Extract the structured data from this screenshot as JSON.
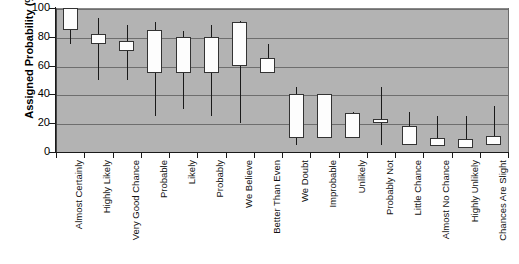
{
  "chart_data": {
    "type": "box",
    "title": "",
    "xlabel": "",
    "ylabel": "Assigned Probability (%)",
    "ylim": [
      0,
      100
    ],
    "yticks": [
      0,
      20,
      40,
      60,
      80,
      100
    ],
    "grid": true,
    "legend": "none",
    "plot_background": "#b3b3b3",
    "box_fill": "#fdfdfd",
    "box_stroke": "#333333",
    "categories": [
      "Almost Certainly",
      "Highly Likely",
      "Very Good Chance",
      "Probable",
      "Likely",
      "Probably",
      "We Believe",
      "Better Than Even",
      "We Doubt",
      "Improbable",
      "Unlikely",
      "Probably Not",
      "Little Chance",
      "Almost No Chance",
      "Highly Unlikely",
      "Chances Are Slight"
    ],
    "boxes": [
      {
        "category": "Almost Certainly",
        "whisker_low": 75,
        "q1": 85,
        "q3": 100,
        "whisker_high": 100
      },
      {
        "category": "Highly Likely",
        "whisker_low": 50,
        "q1": 75,
        "q3": 82,
        "whisker_high": 93
      },
      {
        "category": "Very Good Chance",
        "whisker_low": 50,
        "q1": 70,
        "q3": 77,
        "whisker_high": 88
      },
      {
        "category": "Probable",
        "whisker_low": 25,
        "q1": 55,
        "q3": 85,
        "whisker_high": 90
      },
      {
        "category": "Likely",
        "whisker_low": 30,
        "q1": 55,
        "q3": 80,
        "whisker_high": 84
      },
      {
        "category": "Probably",
        "whisker_low": 25,
        "q1": 55,
        "q3": 80,
        "whisker_high": 88
      },
      {
        "category": "We Believe",
        "whisker_low": 20,
        "q1": 60,
        "q3": 90,
        "whisker_high": 91
      },
      {
        "category": "Better Than Even",
        "whisker_low": 55,
        "q1": 55,
        "q3": 65,
        "whisker_high": 75
      },
      {
        "category": "We Doubt",
        "whisker_low": 5,
        "q1": 10,
        "q3": 40,
        "whisker_high": 45
      },
      {
        "category": "Improbable",
        "whisker_low": 10,
        "q1": 10,
        "q3": 40,
        "whisker_high": 40
      },
      {
        "category": "Unlikely",
        "whisker_low": 10,
        "q1": 10,
        "q3": 27,
        "whisker_high": 28
      },
      {
        "category": "Probably Not",
        "whisker_low": 5,
        "q1": 20,
        "q3": 23,
        "whisker_high": 45
      },
      {
        "category": "Little Chance",
        "whisker_low": 5,
        "q1": 5,
        "q3": 18,
        "whisker_high": 28
      },
      {
        "category": "Almost No Chance",
        "whisker_low": 4,
        "q1": 4,
        "q3": 10,
        "whisker_high": 25
      },
      {
        "category": "Highly Unlikely",
        "whisker_low": 3,
        "q1": 3,
        "q3": 9,
        "whisker_high": 25
      },
      {
        "category": "Chances Are Slight",
        "whisker_low": 5,
        "q1": 5,
        "q3": 11,
        "whisker_high": 32
      }
    ]
  }
}
